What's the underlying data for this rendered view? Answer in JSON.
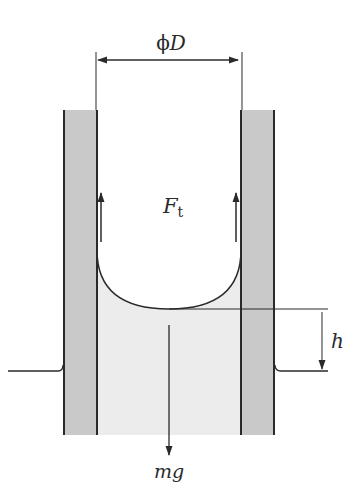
{
  "diagram": {
    "labels": {
      "diameter_symbol": "ϕ",
      "diameter_var": "D",
      "force_var": "F",
      "force_sub": "t",
      "height_var": "h",
      "weight_var": "mg"
    },
    "colors": {
      "wall_fill": "#c9c9c9",
      "liquid_fill": "#ececec",
      "line": "#2a2a2a",
      "background": "#ffffff"
    }
  }
}
